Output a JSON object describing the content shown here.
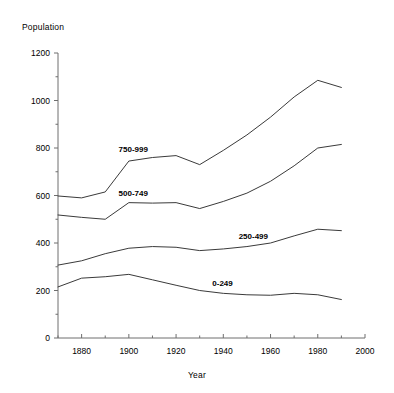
{
  "chart_data": {
    "type": "line",
    "title": "",
    "xlabel": "Year",
    "ylabel": "Population",
    "xlim": [
      1870,
      2000
    ],
    "ylim": [
      0,
      1200
    ],
    "grid": false,
    "legend_position": "inline-labels",
    "x": [
      1870,
      1880,
      1890,
      1900,
      1910,
      1920,
      1930,
      1940,
      1950,
      1960,
      1970,
      1980,
      1990
    ],
    "xticks": [
      1880,
      1900,
      1920,
      1940,
      1960,
      1980,
      2000
    ],
    "xtick_labels": [
      "1880",
      "1900",
      "1920",
      "1940",
      "1960",
      "1980",
      "2000"
    ],
    "yticks": [
      0,
      200,
      400,
      600,
      800,
      1000,
      1200
    ],
    "ytick_labels": [
      "0",
      "200",
      "400",
      "600",
      "800",
      "1000",
      "1200"
    ],
    "yminor_ticks": [
      100,
      300,
      500,
      700,
      900,
      1100
    ],
    "series": [
      {
        "name": "750-999",
        "label": "750-999",
        "values": [
          598,
          590,
          615,
          745,
          760,
          768,
          730,
          790,
          855,
          930,
          1015,
          1085,
          1055
        ]
      },
      {
        "name": "500-749",
        "label": "500-749",
        "values": [
          518,
          508,
          500,
          570,
          568,
          570,
          545,
          575,
          610,
          660,
          725,
          800,
          815
        ]
      },
      {
        "name": "250-499",
        "label": "250-499",
        "values": [
          307,
          325,
          355,
          378,
          385,
          382,
          368,
          375,
          385,
          400,
          430,
          458,
          452
        ]
      },
      {
        "name": "0-249",
        "label": "0-249",
        "values": [
          215,
          252,
          258,
          268,
          245,
          222,
          200,
          188,
          182,
          180,
          188,
          182,
          162
        ]
      }
    ]
  },
  "labels": {
    "y_axis_title": "Population",
    "x_axis_title": "Year"
  },
  "colors": {
    "line": "#3a3a3a",
    "axis": "#6e6e6e",
    "text": "#000000",
    "background": "#ffffff"
  }
}
